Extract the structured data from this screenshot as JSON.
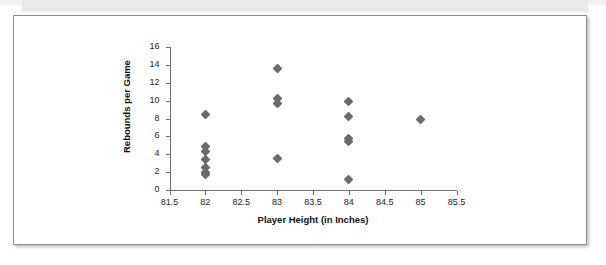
{
  "chart_data": {
    "type": "scatter",
    "title": "",
    "xlabel": "Player Height (in Inches)",
    "ylabel": "Rebounds per Game",
    "xlim": [
      81.5,
      85.5
    ],
    "ylim": [
      0,
      16
    ],
    "xticks": [
      "81.5",
      "82",
      "82.5",
      "83",
      "83.5",
      "84",
      "84.5",
      "85",
      "85.5"
    ],
    "xtick_values": [
      81.5,
      82,
      82.5,
      83,
      83.5,
      84,
      84.5,
      85,
      85.5
    ],
    "yticks": [
      "0",
      "2",
      "4",
      "6",
      "8",
      "10",
      "12",
      "14",
      "16"
    ],
    "ytick_values": [
      0,
      2,
      4,
      6,
      8,
      10,
      12,
      14,
      16
    ],
    "grid": false,
    "legend": "none",
    "marker_shape": "diamond",
    "marker_color": "#6b6b6b",
    "points": [
      {
        "x": 82,
        "y": 8.4
      },
      {
        "x": 82,
        "y": 4.9
      },
      {
        "x": 82,
        "y": 4.3
      },
      {
        "x": 82,
        "y": 3.4
      },
      {
        "x": 82,
        "y": 2.5
      },
      {
        "x": 82,
        "y": 2.0
      },
      {
        "x": 82,
        "y": 1.7
      },
      {
        "x": 83,
        "y": 13.6
      },
      {
        "x": 83,
        "y": 10.2
      },
      {
        "x": 83,
        "y": 9.7
      },
      {
        "x": 83,
        "y": 3.5
      },
      {
        "x": 84,
        "y": 9.9
      },
      {
        "x": 84,
        "y": 8.2
      },
      {
        "x": 84,
        "y": 5.8
      },
      {
        "x": 84,
        "y": 5.4
      },
      {
        "x": 84,
        "y": 1.2
      },
      {
        "x": 85,
        "y": 7.9
      }
    ]
  }
}
